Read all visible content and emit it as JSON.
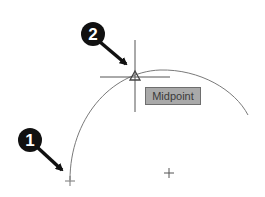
{
  "diagram": {
    "callouts": [
      {
        "number": "1",
        "target": "arc-start-point"
      },
      {
        "number": "2",
        "target": "midpoint-snap-marker"
      }
    ],
    "tooltip": {
      "label": "Midpoint"
    },
    "colors": {
      "badge": "#111111",
      "arc": "#7a7a7a",
      "crosshair": "#555555",
      "tooltip_bg": "#a9a9a9",
      "tooltip_border": "#6e6e6e"
    }
  }
}
